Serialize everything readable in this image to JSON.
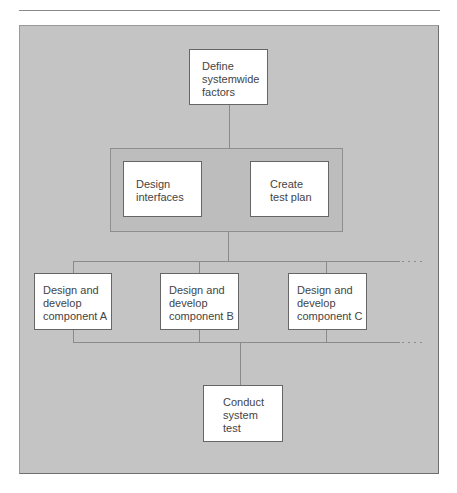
{
  "diagram": {
    "top": {
      "lines": [
        "Define",
        "systemwide",
        "factors"
      ]
    },
    "group": [
      {
        "lines": [
          "Design",
          "interfaces"
        ]
      },
      {
        "lines": [
          "Create",
          "test plan"
        ]
      }
    ],
    "components": [
      {
        "lines": [
          "Design and",
          "develop",
          "component A"
        ]
      },
      {
        "lines": [
          "Design and",
          "develop",
          "component B"
        ]
      },
      {
        "lines": [
          "Design and",
          "develop",
          "component C"
        ]
      }
    ],
    "bottom": {
      "lines": [
        "Conduct",
        "system",
        "test"
      ]
    }
  },
  "colors": {
    "panel": "#c4c4c4",
    "box": "#ffffff",
    "line": "#8a8a8a"
  }
}
